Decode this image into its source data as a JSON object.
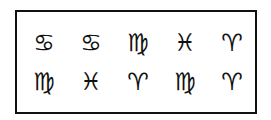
{
  "grid": {
    "rows": [
      [
        "♋︎",
        "♋︎",
        "♍︎",
        "♓︎",
        "♈︎"
      ],
      [
        "♍︎",
        "♓︎",
        "♈︎",
        "♍︎",
        "♈︎"
      ]
    ],
    "names": [
      [
        "cancer",
        "cancer",
        "virgo",
        "pisces",
        "aries"
      ],
      [
        "virgo",
        "pisces",
        "aries",
        "virgo",
        "aries"
      ]
    ]
  }
}
